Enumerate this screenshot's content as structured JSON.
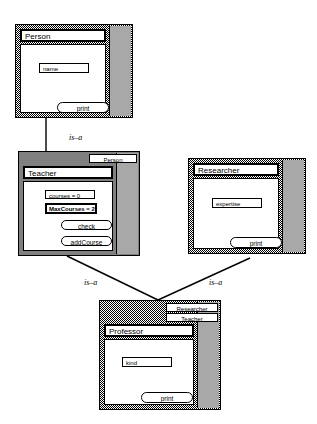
{
  "diagram": {
    "colors": {
      "shadow_gray": "#a8a8a8",
      "frame_pattern": "#808080",
      "line": "#000000",
      "panel_white": "#ffffff"
    }
  },
  "nodes": {
    "person": {
      "title": "Person",
      "attributes": [
        {
          "label": "name",
          "selected": false
        }
      ],
      "methods": [
        {
          "label": "print"
        }
      ],
      "super_tabs": []
    },
    "teacher": {
      "title": "Teacher",
      "attributes": [
        {
          "label": "courses = 0",
          "selected": false
        },
        {
          "label": "MaxCourses = 2",
          "selected": true
        }
      ],
      "methods": [
        {
          "label": "check"
        },
        {
          "label": "addCourse"
        }
      ],
      "super_tabs": [
        {
          "label": "Person"
        }
      ]
    },
    "researcher": {
      "title": "Researcher",
      "attributes": [
        {
          "label": "expertise",
          "selected": false
        }
      ],
      "methods": [
        {
          "label": "print"
        }
      ],
      "super_tabs": []
    },
    "professor": {
      "title": "Professor",
      "attributes": [
        {
          "label": "kind",
          "selected": false
        }
      ],
      "methods": [
        {
          "label": "print"
        }
      ],
      "super_tabs": [
        {
          "label": "Researcher"
        },
        {
          "label": "Teacher"
        }
      ]
    }
  },
  "edges": [
    {
      "id": "person-teacher",
      "label": "is–a",
      "from": "person",
      "to": "teacher"
    },
    {
      "id": "teacher-professor",
      "label": "is–a",
      "from": "teacher",
      "to": "professor"
    },
    {
      "id": "researcher-professor",
      "label": "is–a",
      "from": "researcher",
      "to": "professor"
    }
  ]
}
